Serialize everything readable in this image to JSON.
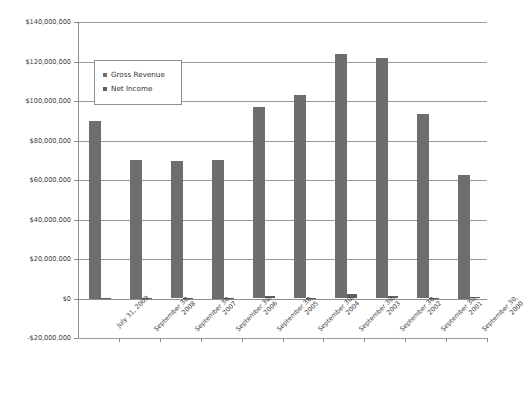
{
  "chart_data": {
    "type": "bar",
    "title": "",
    "xlabel": "",
    "ylabel": "",
    "ylim": [
      -20000000,
      140000000
    ],
    "ytick_step": 20000000,
    "grid": true,
    "legend_position": "upper-left-inside",
    "categories": [
      "July 31, 2009",
      "September 30, 2008",
      "September 30, 2007",
      "September 30, 2006",
      "September 30, 2005",
      "September 30, 2004",
      "September 30, 2003",
      "September 30, 2002",
      "September 30, 2001",
      "September 30, 2000"
    ],
    "category_lines": [
      [
        "July 31, 2009",
        ""
      ],
      [
        "September 30,",
        "2008"
      ],
      [
        "September 30,",
        "2007"
      ],
      [
        "September 30,",
        "2006"
      ],
      [
        "September 30,",
        "2005"
      ],
      [
        "September 30,",
        "2004"
      ],
      [
        "September 30,",
        "2003"
      ],
      [
        "September 30,",
        "2002"
      ],
      [
        "September 30,",
        "2001"
      ],
      [
        "September 30,",
        "2000"
      ]
    ],
    "ytick_labels": [
      "$140,000,000",
      "$120,000,000",
      "$100,000,000",
      "$80,000,000",
      "$60,000,000",
      "$40,000,000",
      "$20,000,000",
      "$0",
      "-$20,000,000"
    ],
    "ytick_values": [
      140000000,
      120000000,
      100000000,
      80000000,
      60000000,
      40000000,
      20000000,
      0,
      -20000000
    ],
    "series": [
      {
        "name": "Gross Revenue",
        "color": "#6e6e6e",
        "values": [
          90000000,
          70000000,
          69500000,
          70000000,
          97000000,
          103000000,
          124000000,
          122000000,
          93500000,
          62500000
        ]
      },
      {
        "name": "Net Income",
        "color": "#5f5f5f",
        "values": [
          300000,
          400000,
          300000,
          400000,
          1300000,
          500000,
          2200000,
          1300000,
          500000,
          600000
        ]
      }
    ]
  },
  "legend": {
    "items": [
      {
        "label": "Gross Revenue",
        "color": "#6e6e6e"
      },
      {
        "label": "Net Income",
        "color": "#5f5f5f"
      }
    ]
  },
  "colors": {
    "bar_gross": "#6e6e6e",
    "bar_net": "#5f5f5f",
    "gridline": "#9a9a9a",
    "axis": "#8c8c8c",
    "text": "#3d3d3d",
    "background": "#ffffff"
  }
}
